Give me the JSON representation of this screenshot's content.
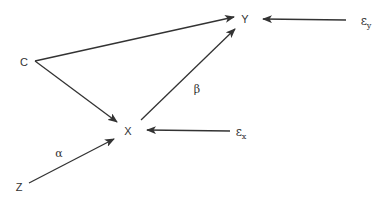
{
  "diagram": {
    "type": "causal-dag",
    "nodes": {
      "C": {
        "label": "C",
        "x": 24,
        "y": 62
      },
      "Y": {
        "label": "Y",
        "x": 245,
        "y": 19
      },
      "X": {
        "label": "X",
        "x": 128,
        "y": 131
      },
      "Z": {
        "label": "Z",
        "x": 19,
        "y": 187
      }
    },
    "error_terms": {
      "ey": {
        "symbol": "ε",
        "subscript": "y",
        "x": 366,
        "y": 22
      },
      "ex": {
        "symbol": "ε",
        "subscript": "x",
        "x": 241,
        "y": 133
      }
    },
    "coefficients": {
      "beta": {
        "label": "β",
        "x": 197,
        "y": 89
      },
      "alpha": {
        "label": "α",
        "x": 59,
        "y": 153
      }
    },
    "edges": [
      {
        "from": "C",
        "to": "Y",
        "x1": 35,
        "y1": 61,
        "x2": 234,
        "y2": 17
      },
      {
        "from": "C",
        "to": "X",
        "x1": 35,
        "y1": 61,
        "x2": 117,
        "y2": 122
      },
      {
        "from": "Z",
        "to": "X",
        "x1": 29,
        "y1": 183,
        "x2": 114,
        "y2": 139
      },
      {
        "from": "X",
        "to": "Y",
        "label": "β",
        "x1": 141,
        "y1": 120,
        "x2": 235,
        "y2": 29
      },
      {
        "from": "ey",
        "to": "Y",
        "x1": 346,
        "y1": 20,
        "x2": 263,
        "y2": 19
      },
      {
        "from": "ex",
        "to": "X",
        "x1": 230,
        "y1": 131,
        "x2": 147,
        "y2": 130
      }
    ],
    "colors": {
      "line": "#333333",
      "text": "#333333",
      "background": "#ffffff"
    }
  }
}
